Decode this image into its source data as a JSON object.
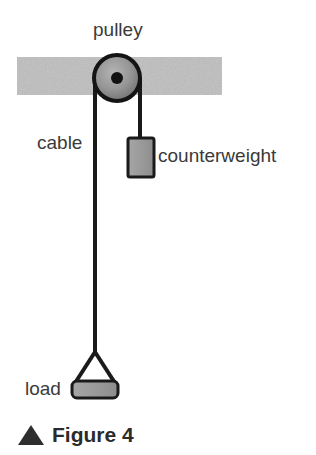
{
  "figure": {
    "caption_marker": "▲",
    "caption_text": "Figure 4"
  },
  "labels": {
    "pulley": "pulley",
    "cable": "cable",
    "counterweight": "counterweight",
    "load": "load"
  },
  "colors": {
    "beam_fill": "#c9c9c9",
    "block_fill": "#9a9a9a",
    "outline": "#1a1a1a",
    "pulley_fill": "#8f8f8f",
    "pulley_hub": "#111111",
    "text": "#3a3a3a",
    "caption_text": "#2b2b2b",
    "background": "#ffffff"
  },
  "geometry": {
    "beam": {
      "x": 17,
      "y": 57,
      "width": 205,
      "height": 38
    },
    "pulley": {
      "cx": 117,
      "cy": 78,
      "r": 23,
      "hub_r": 6
    },
    "cable_left_x": 95,
    "cable_right_x": 140,
    "cable_bottom_y": 352,
    "counterweight": {
      "x": 128,
      "y": 138,
      "width": 26,
      "height": 39
    },
    "load_block": {
      "x": 72,
      "y": 381,
      "width": 46,
      "height": 17
    },
    "sling_apex": {
      "x": 95,
      "y": 352
    }
  }
}
